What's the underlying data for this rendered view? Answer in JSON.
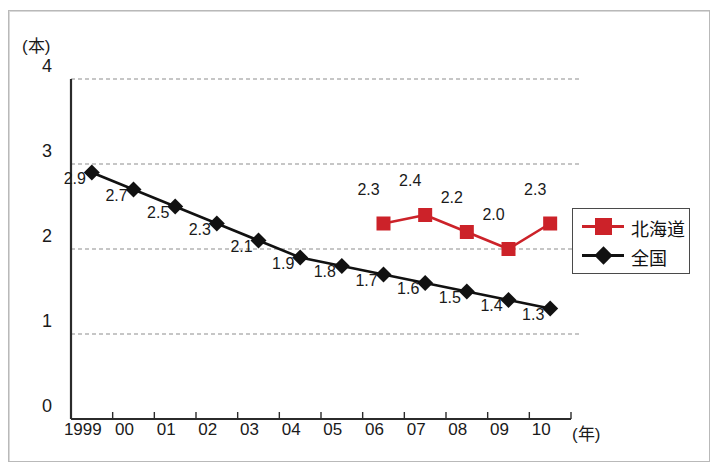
{
  "chart_data": {
    "type": "line",
    "title": "",
    "xlabel": "(年)",
    "ylabel": "(本)",
    "ylim": [
      0,
      4
    ],
    "yticks": [
      "0",
      "1",
      "2",
      "3",
      "4"
    ],
    "grid": "horizontal-dashed",
    "legend_position": "right",
    "categories": [
      "1999",
      "00",
      "01",
      "02",
      "03",
      "04",
      "05",
      "06",
      "07",
      "08",
      "09",
      "10"
    ],
    "series": [
      {
        "name": "北海道",
        "color": "#cc2229",
        "marker": "square",
        "values": [
          null,
          null,
          null,
          null,
          null,
          null,
          null,
          2.3,
          2.4,
          2.2,
          2.0,
          2.3
        ],
        "labels": [
          "",
          "",
          "",
          "",
          "",
          "",
          "",
          "2.3",
          "2.4",
          "2.2",
          "2.0",
          "2.3"
        ]
      },
      {
        "name": "全国",
        "color": "#111111",
        "marker": "diamond",
        "values": [
          2.9,
          2.7,
          2.5,
          2.3,
          2.1,
          1.9,
          1.8,
          1.7,
          1.6,
          1.5,
          1.4,
          1.3
        ],
        "labels": [
          "2.9",
          "2.7",
          "2.5",
          "2.3",
          "2.1",
          "1.9",
          "1.8",
          "1.7",
          "1.6",
          "1.5",
          "1.4",
          "1.3"
        ]
      }
    ]
  },
  "legend": {
    "items": [
      {
        "label": "北海道",
        "color": "#cc2229",
        "marker": "square"
      },
      {
        "label": "全国",
        "color": "#111111",
        "marker": "diamond"
      }
    ]
  }
}
